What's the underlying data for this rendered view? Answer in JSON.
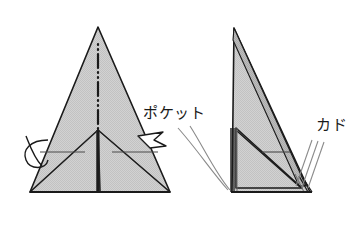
{
  "diagram": {
    "type": "origami-instruction",
    "background_color": "#ffffff",
    "paper_fill_color": "#cfcfcf",
    "paper_fill_color_shaded": "#b9b9b9",
    "line_color": "#1a1a1a",
    "leader_line_color": "#8a8a8a",
    "figures": [
      {
        "id": "figure-left",
        "name": "front-view-folded-paper",
        "description": "Tall triangular folded paper seen from the front with a vertical mountain fold line down the middle and two lower flap triangles",
        "apex": {
          "x": 98,
          "y": 27
        },
        "base_left": {
          "x": 30,
          "y": 192
        },
        "base_right": {
          "x": 170,
          "y": 192
        },
        "center_fold_line": {
          "style": "dash-dot-dot",
          "name": "mountain-fold-line",
          "from": {
            "x": 98,
            "y": 44
          },
          "to": {
            "x": 98,
            "y": 190
          }
        }
      },
      {
        "id": "figure-right",
        "name": "side-view-folded-paper",
        "description": "Narrow right triangle seen edge-on showing stacked paper layers along the left edge and bottom right corner",
        "apex": {
          "x": 234,
          "y": 28
        },
        "base_left": {
          "x": 232,
          "y": 192
        },
        "base_right": {
          "x": 310,
          "y": 192
        }
      }
    ],
    "annotations": [
      {
        "id": "label-pocket",
        "name": "pocket-label",
        "text": "ポケット",
        "x": 143,
        "y": 118,
        "leader_lines": 2,
        "points_to": "bottom-left stacked layers of the side view"
      },
      {
        "id": "label-kado",
        "name": "corner-label",
        "text": "カド",
        "x": 316,
        "y": 130,
        "leader_lines": 3,
        "points_to": "bottom-right corner layers of the side view"
      }
    ],
    "arrows": [
      {
        "id": "arrow-curl-left",
        "name": "wrap-around-curl-arrow",
        "symbol": "loop",
        "x": 33,
        "y": 150
      },
      {
        "id": "arrow-open-right",
        "name": "open-pocket-arrow",
        "symbol": "hollow-arrowhead",
        "x": 155,
        "y": 140
      }
    ]
  }
}
